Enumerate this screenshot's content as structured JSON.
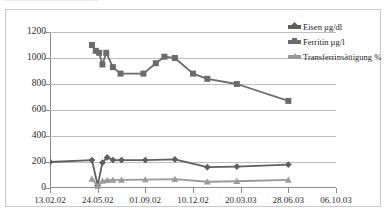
{
  "page": {
    "clipped_header_text": "••••••••••••••••••••••••••••••••••••"
  },
  "colors": {
    "eisen": "#5f5f5f",
    "ferritin": "#6b6b6b",
    "transferrin": "#9a9a9a",
    "grid": "#bfbfbf",
    "axis": "#8c8c8c",
    "frame": "#c9c9c9",
    "text": "#1a1a1a"
  },
  "legend": {
    "position": "top-right",
    "items": [
      {
        "label": "Eisen µg/dl",
        "color": "#5f5f5f",
        "marker": "diamond"
      },
      {
        "label": "Ferritin µg/l",
        "color": "#6b6b6b",
        "marker": "square"
      },
      {
        "label": "Transferrinsättigung %",
        "color": "#9a9a9a",
        "marker": "triangle"
      }
    ]
  },
  "chart_data": {
    "type": "line",
    "title": "",
    "xlabel": "",
    "ylabel": "",
    "grid": true,
    "ylim": [
      0,
      1200
    ],
    "yticks": [
      0,
      200,
      400,
      600,
      800,
      1000,
      1200
    ],
    "ytick_labels": [
      "0",
      "200",
      "400",
      "600",
      "800",
      "1000",
      "1200"
    ],
    "xtick_labels": [
      "13.02.02",
      "24.05.02",
      "01.09.02",
      "10.12.02",
      "20.03.03",
      "28.06.03",
      "06.10.03"
    ],
    "xtick_positions_days": [
      0,
      100,
      200,
      300,
      400,
      500,
      600
    ],
    "xlim_days": [
      0,
      600
    ],
    "series": [
      {
        "name": "Ferritin µg/l",
        "color": "#6b6b6b",
        "marker": "square",
        "x_days": [
          88,
          96,
          103,
          110,
          118,
          132,
          148,
          196,
          222,
          240,
          262,
          300,
          330,
          392,
          500
        ],
        "values": [
          1100,
          1055,
          1040,
          950,
          1040,
          930,
          880,
          880,
          960,
          1010,
          1000,
          880,
          840,
          800,
          670
        ]
      },
      {
        "name": "Eisen µg/dl",
        "color": "#5f5f5f",
        "marker": "diamond",
        "x_days": [
          0,
          88,
          100,
          110,
          120,
          132,
          150,
          200,
          262,
          330,
          392,
          500
        ],
        "values": [
          200,
          215,
          20,
          195,
          235,
          215,
          215,
          215,
          220,
          160,
          165,
          180
        ]
      },
      {
        "name": "Transferrinsättigung %",
        "color": "#9a9a9a",
        "marker": "triangle",
        "x_days": [
          88,
          100,
          110,
          120,
          132,
          150,
          200,
          262,
          330,
          392,
          500
        ],
        "values": [
          70,
          15,
          55,
          60,
          62,
          62,
          65,
          68,
          48,
          52,
          62
        ]
      }
    ]
  }
}
